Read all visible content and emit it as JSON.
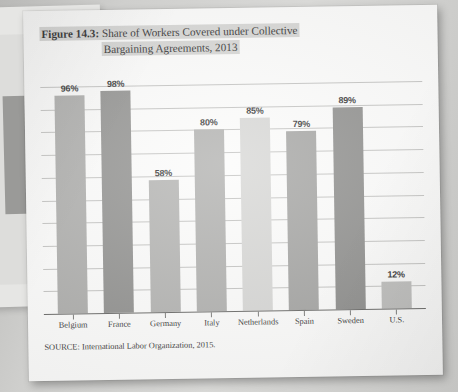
{
  "figure": {
    "label": "Figure 14.3:",
    "title_line_1": "Share of Workers Covered under Collective",
    "title_line_2": "Bargaining Agreements, 2013",
    "source": "SOURCE: International Labor Organization, 2015."
  },
  "chart_data": {
    "type": "bar",
    "title": "Figure 14.3: Share of Workers Covered under Collective Bargaining Agreements, 2013",
    "xlabel": "",
    "ylabel": "",
    "ylim": [
      0,
      100
    ],
    "grid": true,
    "gridline_count": 10,
    "legend": "none",
    "value_suffix": "%",
    "categories": [
      "Belgium",
      "France",
      "Germany",
      "Italy",
      "Netherlands",
      "Spain",
      "Sweden",
      "U.S."
    ],
    "values": [
      96,
      98,
      58,
      80,
      85,
      79,
      89,
      12
    ],
    "labels": [
      "96%",
      "98%",
      "58%",
      "80%",
      "85%",
      "79%",
      "89%",
      "12%"
    ],
    "bar_colors": [
      "#a6a6a4",
      "#878785",
      "#acacaa",
      "#a9a9a7",
      "#d3d3d1",
      "#9c9c9a",
      "#848482",
      "#b8b8b6"
    ]
  },
  "colors": {
    "page": "#fbfbfa",
    "title_highlight": "#d2d2d0",
    "gridline": "#bdbdbb",
    "axis": "#5a5a58",
    "text": "#1b1b1b"
  }
}
